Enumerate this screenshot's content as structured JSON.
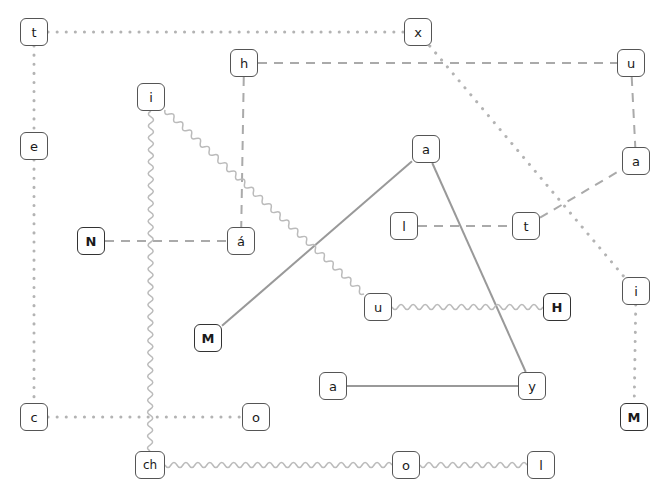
{
  "graph": {
    "title": "node-link diagram",
    "width": 666,
    "height": 498,
    "node_style": {
      "shape": "rounded-rectangle",
      "fill": "#ffffff",
      "stroke": "#555555",
      "text_color": "#1a1a1a"
    },
    "edge_colors": {
      "dotted": "#b3b3b3",
      "dashed": "#aaaaaa",
      "solid": "#999999",
      "wavy": "#bbbbbb"
    },
    "nodes": [
      {
        "id": "n0",
        "label": "t",
        "x": 34,
        "y": 32,
        "bold": false
      },
      {
        "id": "n1",
        "label": "x",
        "x": 418,
        "y": 32,
        "bold": false
      },
      {
        "id": "n2",
        "label": "h",
        "x": 244,
        "y": 63,
        "bold": false
      },
      {
        "id": "n3",
        "label": "u",
        "x": 631,
        "y": 63,
        "bold": false
      },
      {
        "id": "n4",
        "label": "i",
        "x": 151,
        "y": 97,
        "bold": false
      },
      {
        "id": "n5",
        "label": "e",
        "x": 34,
        "y": 146,
        "bold": false
      },
      {
        "id": "n6",
        "label": "a",
        "x": 426,
        "y": 149,
        "bold": false
      },
      {
        "id": "n7",
        "label": "a",
        "x": 636,
        "y": 161,
        "bold": false
      },
      {
        "id": "n8",
        "label": "l",
        "x": 404,
        "y": 226,
        "bold": false
      },
      {
        "id": "n9",
        "label": "t",
        "x": 526,
        "y": 226,
        "bold": false
      },
      {
        "id": "n10",
        "label": "N",
        "x": 91,
        "y": 241,
        "bold": true
      },
      {
        "id": "n11",
        "label": "á",
        "x": 241,
        "y": 241,
        "bold": false
      },
      {
        "id": "n12",
        "label": "i",
        "x": 636,
        "y": 291,
        "bold": false
      },
      {
        "id": "n13",
        "label": "u",
        "x": 378,
        "y": 307,
        "bold": false
      },
      {
        "id": "n14",
        "label": "H",
        "x": 557,
        "y": 307,
        "bold": true
      },
      {
        "id": "n15",
        "label": "M",
        "x": 208,
        "y": 338,
        "bold": true
      },
      {
        "id": "n16",
        "label": "a",
        "x": 333,
        "y": 386,
        "bold": false
      },
      {
        "id": "n17",
        "label": "y",
        "x": 532,
        "y": 386,
        "bold": false
      },
      {
        "id": "n18",
        "label": "c",
        "x": 34,
        "y": 417,
        "bold": false
      },
      {
        "id": "n19",
        "label": "o",
        "x": 256,
        "y": 417,
        "bold": false
      },
      {
        "id": "n20",
        "label": "M",
        "x": 634,
        "y": 417,
        "bold": true
      },
      {
        "id": "n21",
        "label": "ch",
        "x": 150,
        "y": 465,
        "bold": false,
        "wide": true
      },
      {
        "id": "n22",
        "label": "o",
        "x": 406,
        "y": 465,
        "bold": false
      },
      {
        "id": "n23",
        "label": "l",
        "x": 541,
        "y": 465,
        "bold": false
      }
    ],
    "edges": [
      {
        "from": "n0",
        "to": "n1",
        "style": "dotted"
      },
      {
        "from": "n0",
        "to": "n5",
        "style": "dotted"
      },
      {
        "from": "n5",
        "to": "n18",
        "style": "dotted"
      },
      {
        "from": "n18",
        "to": "n19",
        "style": "dotted"
      },
      {
        "from": "n1",
        "to": "n12",
        "style": "dotted"
      },
      {
        "from": "n12",
        "to": "n20",
        "style": "dotted"
      },
      {
        "from": "n2",
        "to": "n3",
        "style": "dashed"
      },
      {
        "from": "n2",
        "to": "n11",
        "style": "dashed"
      },
      {
        "from": "n10",
        "to": "n11",
        "style": "dashed"
      },
      {
        "from": "n3",
        "to": "n7",
        "style": "dashed"
      },
      {
        "from": "n8",
        "to": "n9",
        "style": "dashed"
      },
      {
        "from": "n9",
        "to": "n7",
        "style": "dashed"
      },
      {
        "from": "n15",
        "to": "n6",
        "style": "solid"
      },
      {
        "from": "n6",
        "to": "n17",
        "style": "solid"
      },
      {
        "from": "n16",
        "to": "n17",
        "style": "solid"
      },
      {
        "from": "n4",
        "to": "n21",
        "style": "wavy"
      },
      {
        "from": "n4",
        "to": "n13",
        "style": "wavy"
      },
      {
        "from": "n13",
        "to": "n14",
        "style": "wavy"
      },
      {
        "from": "n21",
        "to": "n22",
        "style": "wavy"
      },
      {
        "from": "n22",
        "to": "n23",
        "style": "wavy"
      }
    ]
  }
}
